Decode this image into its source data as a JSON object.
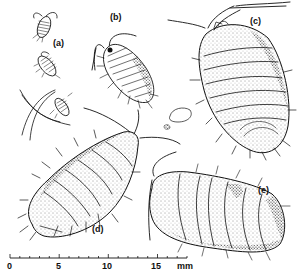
{
  "figure": {
    "labels": {
      "a": "(a)",
      "b": "(b)",
      "c": "(c)",
      "d": "(d)",
      "e": "(e)"
    },
    "scale_bar": {
      "ticks": [
        "0",
        "5",
        "10",
        "15"
      ],
      "unit": "mm",
      "range_mm": [
        0,
        18
      ]
    },
    "specimens": [
      {
        "id": "a",
        "count": 3,
        "description": "three small juvenile isopods"
      },
      {
        "id": "b",
        "description": "small isopod with long antennae, dorsal view"
      },
      {
        "id": "c",
        "description": "large stippled isopod, oblique view"
      },
      {
        "id": "d",
        "description": "elongate spiny isopod, lateral-dorsal view"
      },
      {
        "id": "e",
        "description": "rolled/oval isopod, heavily stippled"
      }
    ]
  }
}
